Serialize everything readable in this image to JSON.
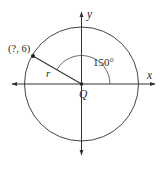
{
  "diagram": {
    "axes": {
      "x_label": "x",
      "y_label": "y",
      "origin_label": "Q"
    },
    "circle": {
      "center": "Q"
    },
    "radius_label": "r",
    "point_label": "(?, 6)",
    "angle_label": "150°",
    "colors": {
      "stroke": "#333333",
      "background": "#ffffff"
    }
  }
}
